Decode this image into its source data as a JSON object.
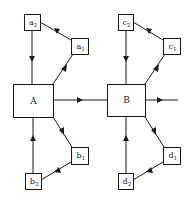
{
  "diagram": {
    "type": "block-diagram",
    "colors": {
      "stroke": "#1a1a1a",
      "background": "#ffffff"
    },
    "nodes": {
      "A": {
        "label": "A",
        "base": "",
        "sub": ""
      },
      "B": {
        "label": "B",
        "base": "",
        "sub": ""
      },
      "a1": {
        "base": "a",
        "sub": "1"
      },
      "a2": {
        "base": "a",
        "sub": "2"
      },
      "b1": {
        "base": "b",
        "sub": "1"
      },
      "b2": {
        "base": "b",
        "sub": "2"
      },
      "c1": {
        "base": "c",
        "sub": "1"
      },
      "c2": {
        "base": "c",
        "sub": "2"
      },
      "d1": {
        "base": "d",
        "sub": "1"
      },
      "d2": {
        "base": "d",
        "sub": "2"
      }
    },
    "edges": [
      {
        "from": "A",
        "to": "a1"
      },
      {
        "from": "a1",
        "to": "a2"
      },
      {
        "from": "a2",
        "to": "A"
      },
      {
        "from": "A",
        "to": "b1"
      },
      {
        "from": "b1",
        "to": "b2"
      },
      {
        "from": "b2",
        "to": "A"
      },
      {
        "from": "A",
        "to": "B"
      },
      {
        "from": "B",
        "to": "c1"
      },
      {
        "from": "c1",
        "to": "c2"
      },
      {
        "from": "c2",
        "to": "B"
      },
      {
        "from": "B",
        "to": "d1"
      },
      {
        "from": "d1",
        "to": "d2"
      },
      {
        "from": "d2",
        "to": "B"
      },
      {
        "from": "B",
        "to": "output"
      }
    ]
  }
}
